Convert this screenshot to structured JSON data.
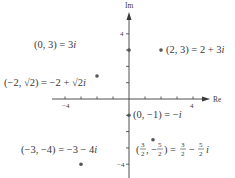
{
  "chart_data": {
    "type": "scatter",
    "title": "",
    "xlabel": "Re",
    "ylabel": "Im",
    "xlim": [
      -4.6,
      4.6
    ],
    "ylim": [
      -4.6,
      5
    ],
    "x_tick_labels": [
      {
        "value": -4,
        "label": "−4"
      },
      {
        "value": 4,
        "label": "4"
      }
    ],
    "y_tick_labels": [
      {
        "value": 4,
        "label": "4"
      },
      {
        "value": -4,
        "label": "−4"
      }
    ],
    "x_ticks": [
      -4,
      -3,
      -2,
      -1,
      1,
      2,
      3,
      4
    ],
    "y_ticks": [
      -4,
      -3,
      -2,
      -1,
      1,
      2,
      3,
      4
    ],
    "grid": false,
    "points": [
      {
        "x": 0,
        "y": 3,
        "label": "(0, 3) = 3i"
      },
      {
        "x": 2,
        "y": 3,
        "label": "(2, 3) = 2 + 3i"
      },
      {
        "x": -2,
        "y": 1.414,
        "label": "(−2, √2) = −2 + √2i"
      },
      {
        "x": 0,
        "y": -1,
        "label": "(0, −1) = −i"
      },
      {
        "x": 1.5,
        "y": -2.5,
        "label": "(3/2, −5/2) = 3/2 − 5/2 i"
      },
      {
        "x": -3,
        "y": -4,
        "label": "(−3, −4) = −3 − 4i"
      }
    ]
  },
  "colors": {
    "ink": "#3a3a3a",
    "point": "#555555"
  }
}
